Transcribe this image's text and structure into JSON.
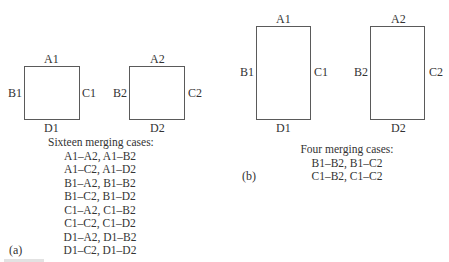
{
  "panel_a": {
    "tag": "(a)",
    "shape1": {
      "top": "A1",
      "left": "B1",
      "right": "C1",
      "bottom": "D1"
    },
    "shape2": {
      "top": "A2",
      "left": "B2",
      "right": "C2",
      "bottom": "D2"
    },
    "caption_title": "Sixteen merging cases:",
    "cases": [
      "A1–A2, A1–B2",
      "A1–C2, A1–D2",
      "B1–A2, B1–B2",
      "B1–C2, B1–D2",
      "C1–A2, C1–B2",
      "C1–C2, C1–D2",
      "D1–A2, D1–B2",
      "D1–C2, D1–D2"
    ]
  },
  "panel_b": {
    "tag": "(b)",
    "shape1": {
      "top": "A1",
      "left": "B1",
      "right": "C1",
      "bottom": "D1"
    },
    "shape2": {
      "top": "A2",
      "left": "B2",
      "right": "C2",
      "bottom": "D2"
    },
    "caption_title": "Four merging cases:",
    "cases": [
      "B1–B2, B1–C2",
      "C1–B2, C1–C2"
    ]
  },
  "colors": {
    "stroke": "#5a5a5a",
    "text": "#333333"
  }
}
